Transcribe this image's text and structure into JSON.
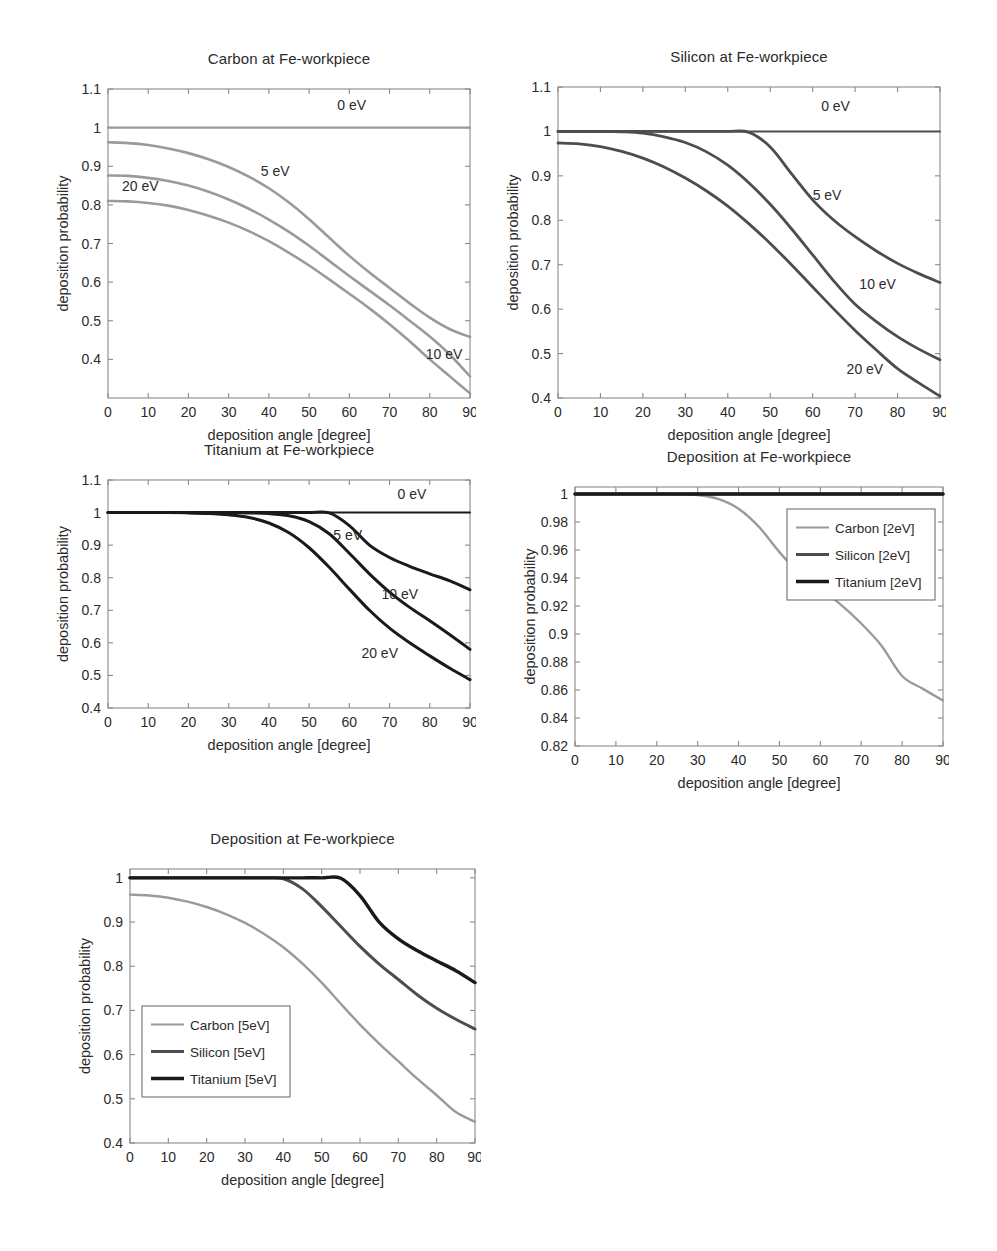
{
  "figure": {
    "axis_xlabel": "deposition angle [degree]",
    "axis_ylabel": "deposition probability",
    "xticks": [
      "0",
      "10",
      "20",
      "30",
      "40",
      "50",
      "60",
      "70",
      "80",
      "90"
    ]
  },
  "colors": {
    "carbon": "#9a9a9a",
    "silicon": "#4d4d4d",
    "titanium": "#1a1a1a",
    "axis": "#8a8a8a",
    "text": "#2b2b2b"
  },
  "chart_data": [
    {
      "id": "carbon-panel",
      "type": "line",
      "title": "Carbon at Fe-workpiece",
      "xlabel": "deposition angle [degree]",
      "ylabel": "deposition probability",
      "xlim": [
        0,
        90
      ],
      "ylim": [
        0.3,
        1.1
      ],
      "xticks": [
        0,
        10,
        20,
        30,
        40,
        50,
        60,
        70,
        80,
        90
      ],
      "yticks": [
        0.4,
        0.5,
        0.6,
        0.7,
        0.8,
        0.9,
        1,
        1.1
      ],
      "ytick_labels": [
        "0.4",
        "0.5",
        "0.6",
        "0.7",
        "0.8",
        "0.9",
        "1",
        "1.1"
      ],
      "grid": false,
      "legend": "none",
      "annotations": [
        {
          "text": "0 eV",
          "x": 57,
          "y": 1.045
        },
        {
          "text": "5 eV",
          "x": 38,
          "y": 0.875
        },
        {
          "text": "20 eV",
          "x": 3.5,
          "y": 0.835
        },
        {
          "text": "10 eV",
          "x": 79,
          "y": 0.4
        }
      ],
      "x": [
        0,
        5,
        10,
        15,
        20,
        25,
        30,
        35,
        40,
        45,
        50,
        55,
        60,
        65,
        70,
        75,
        80,
        85,
        90
      ],
      "series": [
        {
          "name": "0 eV",
          "color": "#9a9a9a",
          "width": 2.2,
          "values": [
            1.0,
            1.0,
            1.0,
            1.0,
            1.0,
            1.0,
            1.0,
            1.0,
            1.0,
            1.0,
            1.0,
            1.0,
            1.0,
            1.0,
            1.0,
            1.0,
            1.0,
            1.0,
            1.0
          ]
        },
        {
          "name": "5 eV",
          "color": "#9a9a9a",
          "width": 2.6,
          "values": [
            0.962,
            0.96,
            0.955,
            0.946,
            0.934,
            0.918,
            0.898,
            0.873,
            0.843,
            0.806,
            0.763,
            0.715,
            0.668,
            0.625,
            0.585,
            0.545,
            0.508,
            0.478,
            0.458
          ]
        },
        {
          "name": "10 eV",
          "color": "#9a9a9a",
          "width": 2.6,
          "values": [
            0.876,
            0.875,
            0.87,
            0.862,
            0.85,
            0.834,
            0.814,
            0.79,
            0.762,
            0.73,
            0.694,
            0.655,
            0.616,
            0.578,
            0.54,
            0.5,
            0.459,
            0.412,
            0.356
          ]
        },
        {
          "name": "20 eV",
          "color": "#9a9a9a",
          "width": 2.6,
          "values": [
            0.81,
            0.809,
            0.805,
            0.798,
            0.787,
            0.772,
            0.754,
            0.732,
            0.706,
            0.676,
            0.643,
            0.607,
            0.57,
            0.532,
            0.491,
            0.447,
            0.4,
            0.356,
            0.312
          ]
        }
      ]
    },
    {
      "id": "silicon-panel",
      "type": "line",
      "title": "Silicon at Fe-workpiece",
      "xlabel": "deposition angle [degree]",
      "ylabel": "deposition probability",
      "xlim": [
        0,
        90
      ],
      "ylim": [
        0.4,
        1.1
      ],
      "xticks": [
        0,
        10,
        20,
        30,
        40,
        50,
        60,
        70,
        80,
        90
      ],
      "yticks": [
        0.4,
        0.5,
        0.6,
        0.7,
        0.8,
        0.9,
        1,
        1.1
      ],
      "ytick_labels": [
        "0.4",
        "0.5",
        "0.6",
        "0.7",
        "0.8",
        "0.9",
        "1",
        "1.1"
      ],
      "grid": false,
      "legend": "none",
      "annotations": [
        {
          "text": "0 eV",
          "x": 62,
          "y": 1.045
        },
        {
          "text": "5 eV",
          "x": 60,
          "y": 0.845
        },
        {
          "text": "10 eV",
          "x": 71,
          "y": 0.645
        },
        {
          "text": "20 eV",
          "x": 68,
          "y": 0.455
        }
      ],
      "x": [
        0,
        5,
        10,
        15,
        20,
        25,
        30,
        35,
        40,
        45,
        50,
        55,
        60,
        65,
        70,
        75,
        80,
        85,
        90
      ],
      "series": [
        {
          "name": "0 eV",
          "color": "#4d4d4d",
          "width": 2.0,
          "values": [
            1.0,
            1.0,
            1.0,
            1.0,
            1.0,
            1.0,
            1.0,
            1.0,
            1.0,
            1.0,
            1.0,
            1.0,
            1.0,
            1.0,
            1.0,
            1.0,
            1.0,
            1.0,
            1.0
          ]
        },
        {
          "name": "5 eV",
          "color": "#4d4d4d",
          "width": 2.8,
          "values": [
            1.0,
            1.0,
            1.0,
            1.0,
            1.0,
            1.0,
            1.0,
            1.0,
            1.0,
            0.998,
            0.965,
            0.905,
            0.846,
            0.8,
            0.763,
            0.731,
            0.703,
            0.68,
            0.66
          ]
        },
        {
          "name": "10 eV",
          "color": "#4d4d4d",
          "width": 2.8,
          "values": [
            1.0,
            1.0,
            1.0,
            0.999,
            0.996,
            0.988,
            0.975,
            0.954,
            0.924,
            0.884,
            0.836,
            0.781,
            0.722,
            0.663,
            0.611,
            0.572,
            0.538,
            0.51,
            0.486
          ]
        },
        {
          "name": "20 eV",
          "color": "#4d4d4d",
          "width": 2.8,
          "values": [
            0.974,
            0.972,
            0.966,
            0.955,
            0.94,
            0.92,
            0.895,
            0.866,
            0.832,
            0.792,
            0.748,
            0.7,
            0.65,
            0.6,
            0.552,
            0.508,
            0.466,
            0.434,
            0.404
          ]
        }
      ]
    },
    {
      "id": "titanium-panel",
      "type": "line",
      "title": "Titanium at Fe-workpiece",
      "xlabel": "deposition angle [degree]",
      "ylabel": "deposition probability",
      "xlim": [
        0,
        90
      ],
      "ylim": [
        0.4,
        1.1
      ],
      "xticks": [
        0,
        10,
        20,
        30,
        40,
        50,
        60,
        70,
        80,
        90
      ],
      "yticks": [
        0.4,
        0.5,
        0.6,
        0.7,
        0.8,
        0.9,
        1,
        1.1
      ],
      "ytick_labels": [
        "0.4",
        "0.5",
        "0.6",
        "0.7",
        "0.8",
        "0.9",
        "1",
        "1.1"
      ],
      "grid": false,
      "legend": "none",
      "annotations": [
        {
          "text": "0 eV",
          "x": 72,
          "y": 1.042
        },
        {
          "text": "5 eV",
          "x": 56,
          "y": 0.915
        },
        {
          "text": "10 eV",
          "x": 68,
          "y": 0.735
        },
        {
          "text": "20 eV",
          "x": 63,
          "y": 0.555
        }
      ],
      "x": [
        0,
        5,
        10,
        15,
        20,
        25,
        30,
        35,
        40,
        45,
        50,
        55,
        60,
        65,
        70,
        75,
        80,
        85,
        90
      ],
      "series": [
        {
          "name": "0 eV",
          "color": "#1a1a1a",
          "width": 2.0,
          "values": [
            1.0,
            1.0,
            1.0,
            1.0,
            1.0,
            1.0,
            1.0,
            1.0,
            1.0,
            1.0,
            1.0,
            1.0,
            1.0,
            1.0,
            1.0,
            1.0,
            1.0,
            1.0,
            1.0
          ]
        },
        {
          "name": "5 eV",
          "color": "#1a1a1a",
          "width": 3.0,
          "values": [
            1.0,
            1.0,
            1.0,
            1.0,
            1.0,
            1.0,
            1.0,
            1.0,
            1.0,
            1.0,
            1.0,
            0.999,
            0.96,
            0.9,
            0.862,
            0.835,
            0.812,
            0.79,
            0.763
          ]
        },
        {
          "name": "10 eV",
          "color": "#1a1a1a",
          "width": 3.0,
          "values": [
            1.0,
            1.0,
            1.0,
            1.0,
            1.0,
            1.0,
            1.0,
            0.999,
            0.997,
            0.99,
            0.972,
            0.935,
            0.875,
            0.812,
            0.756,
            0.709,
            0.668,
            0.625,
            0.58
          ]
        },
        {
          "name": "20 eV",
          "color": "#1a1a1a",
          "width": 3.0,
          "values": [
            1.0,
            1.0,
            1.0,
            1.0,
            0.999,
            0.997,
            0.993,
            0.985,
            0.968,
            0.938,
            0.892,
            0.832,
            0.765,
            0.7,
            0.645,
            0.6,
            0.56,
            0.522,
            0.487
          ]
        }
      ]
    },
    {
      "id": "deposition-2ev-panel",
      "type": "line",
      "title": "Deposition at Fe-workpiece",
      "xlabel": "deposition angle [degree]",
      "ylabel": "deposition probability",
      "xlim": [
        0,
        90
      ],
      "ylim": [
        0.82,
        1.005
      ],
      "xticks": [
        0,
        10,
        20,
        30,
        40,
        50,
        60,
        70,
        80,
        90
      ],
      "yticks": [
        0.82,
        0.84,
        0.86,
        0.88,
        0.9,
        0.92,
        0.94,
        0.96,
        0.98,
        1
      ],
      "ytick_labels": [
        "0.82",
        "0.84",
        "0.86",
        "0.88",
        "0.9",
        "0.92",
        "0.94",
        "0.96",
        "0.98",
        "1"
      ],
      "grid": false,
      "legend": "upper-right",
      "legend_entries": [
        {
          "label": "Carbon [2eV]",
          "color": "#9a9a9a",
          "width": 2.2
        },
        {
          "label": "Silicon [2eV]",
          "color": "#4d4d4d",
          "width": 3.0
        },
        {
          "label": "Titanium [2eV]",
          "color": "#1a1a1a",
          "width": 3.6
        }
      ],
      "x": [
        0,
        5,
        10,
        15,
        20,
        25,
        30,
        35,
        40,
        45,
        50,
        55,
        60,
        65,
        70,
        75,
        80,
        85,
        90
      ],
      "series": [
        {
          "name": "Carbon [2eV]",
          "color": "#9a9a9a",
          "width": 2.4,
          "values": [
            1.0,
            1.0,
            1.0,
            1.0,
            1.0,
            0.9998,
            0.9993,
            0.9965,
            0.9895,
            0.9765,
            0.9585,
            0.943,
            0.932,
            0.921,
            0.9075,
            0.8915,
            0.87,
            0.861,
            0.8525,
            0.849
          ]
        },
        {
          "name": "Silicon [2eV]",
          "color": "#4d4d4d",
          "width": 3.0,
          "values": [
            1.0,
            1.0,
            1.0,
            1.0,
            1.0,
            1.0,
            1.0,
            1.0,
            1.0,
            1.0,
            1.0,
            1.0,
            1.0,
            1.0,
            1.0,
            1.0,
            1.0,
            1.0,
            1.0
          ]
        },
        {
          "name": "Titanium [2eV]",
          "color": "#1a1a1a",
          "width": 3.4,
          "values": [
            1.0,
            1.0,
            1.0,
            1.0,
            1.0,
            1.0,
            1.0,
            1.0,
            1.0,
            1.0,
            1.0,
            1.0,
            1.0,
            1.0,
            1.0,
            1.0,
            1.0,
            1.0,
            1.0
          ]
        }
      ]
    },
    {
      "id": "deposition-5ev-panel",
      "type": "line",
      "title": "Deposition at Fe-workpiece",
      "xlabel": "deposition angle [degree]",
      "ylabel": "deposition probability",
      "xlim": [
        0,
        90
      ],
      "ylim": [
        0.4,
        1.02
      ],
      "xticks": [
        0,
        10,
        20,
        30,
        40,
        50,
        60,
        70,
        80,
        90
      ],
      "yticks": [
        0.4,
        0.5,
        0.6,
        0.7,
        0.8,
        0.9,
        1
      ],
      "ytick_labels": [
        "0.4",
        "0.5",
        "0.6",
        "0.7",
        "0.8",
        "0.9",
        "1"
      ],
      "grid": false,
      "legend": "lower-left",
      "legend_entries": [
        {
          "label": "Carbon [5eV]",
          "color": "#9a9a9a",
          "width": 2.2
        },
        {
          "label": "Silicon [5eV]",
          "color": "#4d4d4d",
          "width": 3.0
        },
        {
          "label": "Titanium [5eV]",
          "color": "#1a1a1a",
          "width": 3.6
        }
      ],
      "x": [
        0,
        5,
        10,
        15,
        20,
        25,
        30,
        35,
        40,
        45,
        50,
        55,
        60,
        65,
        70,
        75,
        80,
        85,
        90
      ],
      "series": [
        {
          "name": "Carbon [5eV]",
          "color": "#9a9a9a",
          "width": 2.4,
          "values": [
            0.962,
            0.96,
            0.955,
            0.946,
            0.934,
            0.918,
            0.898,
            0.873,
            0.843,
            0.806,
            0.763,
            0.715,
            0.668,
            0.625,
            0.585,
            0.545,
            0.508,
            0.47,
            0.448
          ]
        },
        {
          "name": "Silicon [5eV]",
          "color": "#4d4d4d",
          "width": 3.0,
          "values": [
            1.0,
            1.0,
            1.0,
            1.0,
            1.0,
            1.0,
            1.0,
            1.0,
            0.998,
            0.975,
            0.935,
            0.89,
            0.845,
            0.805,
            0.77,
            0.735,
            0.705,
            0.68,
            0.658
          ]
        },
        {
          "name": "Titanium [5eV]",
          "color": "#1a1a1a",
          "width": 3.4,
          "values": [
            1.0,
            1.0,
            1.0,
            1.0,
            1.0,
            1.0,
            1.0,
            1.0,
            1.0,
            1.0,
            1.0,
            0.999,
            0.96,
            0.9,
            0.862,
            0.835,
            0.812,
            0.79,
            0.763
          ]
        }
      ]
    }
  ]
}
